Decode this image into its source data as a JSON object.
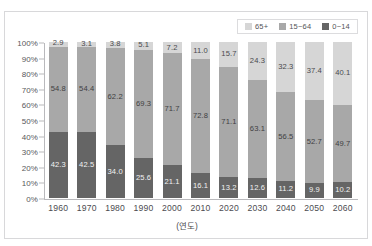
{
  "top_strip": {
    "text": "ㅤ ㅤ ㅤ ㅤ ㅤ ㅤ ㅤ ㅤ ㅤ ㅤ"
  },
  "colors": {
    "old": "#d6d6d6",
    "working": "#a8a8a8",
    "young": "#656565",
    "axis": "#b9b9bc",
    "frame": "#d8d8da",
    "text": "#4c4c50"
  },
  "legend": {
    "items": [
      {
        "label": "65+",
        "color_key": "old"
      },
      {
        "label": "15~64",
        "color_key": "working"
      },
      {
        "label": "0~14",
        "color_key": "young"
      }
    ]
  },
  "chart_data": {
    "type": "bar",
    "stacked": true,
    "normalized": true,
    "title": "",
    "xlabel": "(연도)",
    "ylabel": "",
    "ylim": [
      0,
      100
    ],
    "grid": false,
    "legend_position": "top-right",
    "categories": [
      "1960",
      "1970",
      "1980",
      "1990",
      "2000",
      "2010",
      "2020",
      "2030",
      "2040",
      "2050",
      "2060"
    ],
    "ytick_labels": [
      "0%",
      "10%",
      "20%",
      "30%",
      "40%",
      "50%",
      "60%",
      "70%",
      "80%",
      "90%",
      "100%"
    ],
    "ytick_values": [
      0,
      10,
      20,
      30,
      40,
      50,
      60,
      70,
      80,
      90,
      100
    ],
    "series": [
      {
        "name": "0~14",
        "color_key": "young",
        "values": [
          42.3,
          42.5,
          34.0,
          25.6,
          21.1,
          16.1,
          13.2,
          12.6,
          11.2,
          9.9,
          10.2
        ]
      },
      {
        "name": "15~64",
        "color_key": "working",
        "values": [
          54.8,
          54.4,
          62.2,
          69.3,
          71.7,
          72.8,
          71.1,
          63.1,
          56.5,
          52.7,
          49.7
        ]
      },
      {
        "name": "65+",
        "color_key": "old",
        "values": [
          2.9,
          3.1,
          3.8,
          5.1,
          7.2,
          11.0,
          15.7,
          24.3,
          32.3,
          37.4,
          40.1
        ]
      }
    ]
  }
}
